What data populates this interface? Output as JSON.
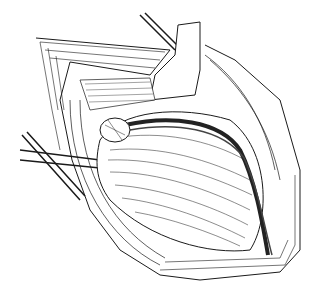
{
  "image": {
    "kind": "surgical line illustration",
    "description": "Black-and-white anatomical drawing of an open surgical field with retracted skin and fat layers, exposed muscle fibers, a large central muscle belly, a blood vessel bundle running diagonally, and surgical instruments (retractors) entering from the upper right and left.",
    "colors": {
      "background": "#ffffff",
      "ink": "#1a1a1a",
      "shade": "#555555"
    }
  }
}
